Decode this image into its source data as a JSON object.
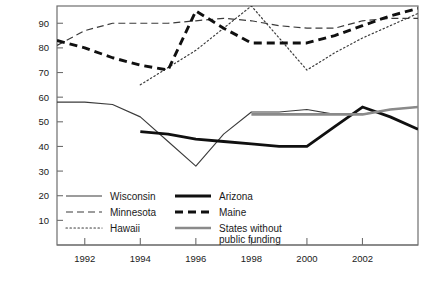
{
  "chart_data": {
    "type": "line",
    "title": "",
    "subtitle": "",
    "xlabel": "",
    "ylabel": "",
    "xlim": [
      1991,
      2004
    ],
    "ylim": [
      0,
      97
    ],
    "grid": false,
    "legend_position": "inside-bottom-left",
    "x_ticks": [
      "1992",
      "1994",
      "1996",
      "1998",
      "2000",
      "2002"
    ],
    "x_tick_values": [
      1992,
      1994,
      1996,
      1998,
      2000,
      2002
    ],
    "y_ticks": [
      "10",
      "20",
      "30",
      "40",
      "50",
      "60",
      "70",
      "80",
      "90"
    ],
    "y_tick_values": [
      10,
      20,
      30,
      40,
      50,
      60,
      70,
      80,
      90
    ],
    "series": [
      {
        "name": "Wisconsin",
        "style": "thin-solid",
        "color": "#3b3b3b",
        "width": 1.1,
        "dash": "none",
        "x": [
          1991,
          1992,
          1993,
          1994,
          1995,
          1996,
          1997,
          1998,
          1999,
          2000,
          2001,
          2002,
          2003,
          2004
        ],
        "values": [
          58,
          58,
          57,
          52,
          42,
          32,
          45,
          54,
          54,
          55,
          53,
          53,
          55,
          56
        ]
      },
      {
        "name": "Minnesota",
        "style": "dashed",
        "color": "#3b3b3b",
        "width": 1.2,
        "dash": "7,4",
        "x": [
          1991,
          1992,
          1993,
          1994,
          1995,
          1996,
          1997,
          1998,
          1999,
          2000,
          2001,
          2002,
          2003,
          2004
        ],
        "values": [
          81,
          87,
          90,
          90,
          90,
          91,
          92,
          91,
          89,
          88,
          88,
          91,
          92,
          92
        ]
      },
      {
        "name": "Hawaii",
        "style": "dotted",
        "color": "#3b3b3b",
        "width": 1.2,
        "dash": "1.4,2.6",
        "x": [
          1994,
          1995,
          1996,
          1997,
          1998,
          1999,
          2000,
          2001,
          2002,
          2003,
          2004
        ],
        "values": [
          65,
          72,
          79,
          88,
          97,
          84,
          71,
          78,
          84,
          89,
          94
        ]
      },
      {
        "name": "Arizona",
        "style": "thick-solid",
        "color": "#101010",
        "width": 2.8,
        "dash": "none",
        "x": [
          1994,
          1995,
          1996,
          1997,
          1998,
          1999,
          2000,
          2001,
          2002,
          2003,
          2004
        ],
        "values": [
          46,
          45,
          43,
          42,
          41,
          40,
          40,
          48,
          56,
          52,
          47
        ]
      },
      {
        "name": "Maine",
        "style": "thick-dashed",
        "color": "#101010",
        "width": 2.9,
        "dash": "8,5",
        "x": [
          1991,
          1992,
          1993,
          1994,
          1995,
          1996,
          1997,
          1998,
          1999,
          2000,
          2001,
          2002,
          2003,
          2004
        ],
        "values": [
          83,
          80,
          76,
          73,
          71,
          95,
          88,
          82,
          82,
          82,
          85,
          89,
          93,
          96
        ]
      },
      {
        "name": "States without public funding",
        "style": "medium-gray-solid",
        "color": "#8a8a8a",
        "width": 2.6,
        "dash": "none",
        "x": [
          1998,
          1999,
          2000,
          2001,
          2002,
          2003,
          2004
        ],
        "values": [
          53,
          53,
          53,
          53,
          53,
          55,
          56
        ]
      }
    ]
  },
  "legend": {
    "entries": [
      {
        "label": "Wisconsin",
        "series": "Wisconsin"
      },
      {
        "label": "Minnesota",
        "series": "Minnesota"
      },
      {
        "label": "Hawaii",
        "series": "Hawaii"
      },
      {
        "label": "Arizona",
        "series": "Arizona"
      },
      {
        "label": "Maine",
        "series": "Maine"
      },
      {
        "label": "States without",
        "label2": "public funding",
        "series": "States without public funding"
      }
    ]
  },
  "colors": {
    "axis": "#6e6e6e",
    "text": "#1a1a1a",
    "dark_series": "#101010",
    "thin_series": "#3b3b3b",
    "gray_series": "#8a8a8a",
    "background": "#ffffff"
  }
}
